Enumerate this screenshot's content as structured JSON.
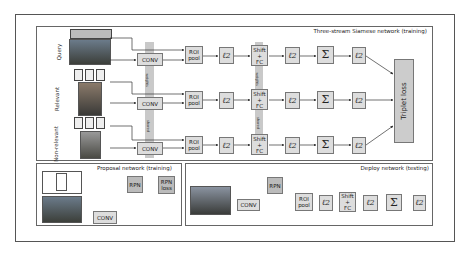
{
  "figure": {
    "panels": {
      "siamese": {
        "title": "Three-stream Siamese network (training)"
      },
      "proposal": {
        "title": "Proposal network (training)"
      },
      "deploy": {
        "title": "Deploy network (testing)"
      }
    },
    "streams": [
      {
        "label": "Query"
      },
      {
        "label": "Relevant"
      },
      {
        "label": "Non-relevant"
      }
    ],
    "blocks": {
      "conv": "CONV",
      "roi_pool": "ROI pool",
      "roi_line1": "ROI",
      "roi_line2": "pool",
      "l2": "ℓ2",
      "shift_fc_line1": "Shift",
      "shift_fc_line2": "+",
      "shift_fc_line3": "FC",
      "sum": "Σ",
      "triplet_loss": "Triplet loss",
      "rpn": "RPN",
      "rpn_loss_line1": "RPN",
      "rpn_loss_line2": "loss"
    },
    "shared_labels": {
      "weights": "weights",
      "shared": "shared"
    }
  }
}
